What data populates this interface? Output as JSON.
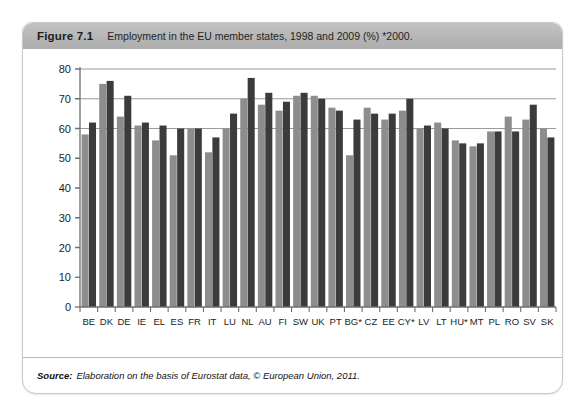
{
  "figure": {
    "number": "Figure 7.1",
    "title": "Employment in the EU member states, 1998 and 2009 (%) *2000.",
    "source_label": "Source:",
    "source_text": "Elaboration on the basis of Eurostat data, © European Union, 2011."
  },
  "colors": {
    "series_1998": "#8d8d8d",
    "series_2009": "#3b3b3b",
    "header_band": "#b6b6b6",
    "axis": "#6f6f6f",
    "gridline": "#9a9a9a",
    "card_border": "#c9c9c9",
    "background": "#ffffff"
  },
  "chart_data": {
    "type": "bar",
    "title": "Employment in the EU member states, 1998 and 2009 (%) *2000.",
    "xlabel": "",
    "ylabel": "",
    "ylim": [
      0,
      80
    ],
    "yticks": [
      0,
      10,
      20,
      30,
      40,
      50,
      60,
      70,
      80
    ],
    "ytick_labels": [
      "0",
      "10",
      "20",
      "30",
      "40",
      "50",
      "60",
      "70",
      "80"
    ],
    "grid": true,
    "grid_axis": "y",
    "legend": false,
    "legend_position": "none",
    "categories": [
      "BE",
      "DK",
      "DE",
      "IE",
      "EL",
      "ES",
      "FR",
      "IT",
      "LU",
      "NL",
      "AU",
      "FI",
      "SW",
      "UK",
      "PT",
      "BG*",
      "CZ",
      "EE",
      "CY*",
      "LV",
      "LT",
      "HU*",
      "MT",
      "PL",
      "RO",
      "SV",
      "SK"
    ],
    "series": [
      {
        "name": "1998",
        "color": "#8d8d8d",
        "values": [
          58,
          75,
          64,
          61,
          56,
          51,
          60,
          52,
          60,
          70,
          68,
          66,
          71,
          71,
          67,
          51,
          67,
          63,
          66,
          60,
          62,
          56,
          54,
          59,
          64,
          63,
          60
        ]
      },
      {
        "name": "2009",
        "color": "#3b3b3b",
        "values": [
          62,
          76,
          71,
          62,
          61,
          60,
          60,
          57,
          65,
          77,
          72,
          69,
          72,
          70,
          66,
          63,
          65,
          65,
          70,
          61,
          60,
          55,
          55,
          59,
          59,
          68,
          57
        ]
      }
    ]
  }
}
